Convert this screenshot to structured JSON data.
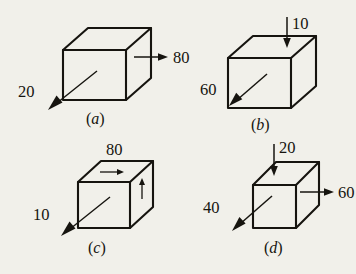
{
  "figure": {
    "background_color": "#f1f0ea",
    "ink_color": "#16140f",
    "panels": [
      {
        "id": "a",
        "caption": "(a)",
        "caption_open": "(",
        "caption_letter": "a",
        "caption_close": ")",
        "forces": [
          {
            "name": "right-face-force",
            "value": "80",
            "direction": "right"
          },
          {
            "name": "front-face-force",
            "value": "20",
            "direction": "down-left"
          }
        ]
      },
      {
        "id": "b",
        "caption": "(b)",
        "caption_open": "(",
        "caption_letter": "b",
        "caption_close": ")",
        "forces": [
          {
            "name": "top-face-force",
            "value": "10",
            "direction": "down"
          },
          {
            "name": "front-face-force",
            "value": "60",
            "direction": "down-left"
          }
        ]
      },
      {
        "id": "c",
        "caption": "(c)",
        "caption_open": "(",
        "caption_letter": "c",
        "caption_close": ")",
        "forces": [
          {
            "name": "top-face-shear",
            "value": "80",
            "direction": "right"
          },
          {
            "name": "right-face-shear",
            "value": "",
            "direction": "up"
          },
          {
            "name": "front-face-force",
            "value": "10",
            "direction": "down-left"
          }
        ]
      },
      {
        "id": "d",
        "caption": "(d)",
        "caption_open": "(",
        "caption_letter": "d",
        "caption_close": ")",
        "forces": [
          {
            "name": "top-face-force",
            "value": "20",
            "direction": "down"
          },
          {
            "name": "right-face-force",
            "value": "60",
            "direction": "right"
          },
          {
            "name": "front-face-force",
            "value": "40",
            "direction": "down-left"
          }
        ]
      }
    ]
  }
}
